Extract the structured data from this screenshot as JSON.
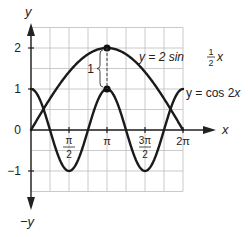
{
  "chart_data": {
    "type": "line",
    "title": "",
    "xlabel": "x",
    "ylabel": "y",
    "ylabel_negative": "−y",
    "xlim": [
      0,
      6.283185307
    ],
    "ylim": [
      -1.5,
      2.5
    ],
    "grid": true,
    "grid_x_step": "π/4",
    "grid_y_step": 0.5,
    "x_ticks": [
      {
        "value": 1.5707963,
        "label_num": "π",
        "label_den": "2"
      },
      {
        "value": 3.1415927,
        "label": "π"
      },
      {
        "value": 4.712389,
        "label_num": "3π",
        "label_den": "2"
      },
      {
        "value": 6.2831853,
        "label": "2π"
      }
    ],
    "y_ticks": [
      {
        "value": 2,
        "label": "2"
      },
      {
        "value": 1,
        "label": "1"
      },
      {
        "value": 0,
        "label": "0"
      },
      {
        "value": -1,
        "label": "−1"
      }
    ],
    "series": [
      {
        "name": "y = 2 sin ½x",
        "expression": "2*sin(x/2)",
        "label_prefix": "y = 2 sin ",
        "label_frac_num": "1",
        "label_frac_den": "2",
        "label_suffix": "x",
        "x": [
          0,
          0.785,
          1.571,
          2.356,
          3.142,
          3.927,
          4.712,
          5.498,
          6.283
        ],
        "y": [
          0,
          0.765,
          1.414,
          1.848,
          2.0,
          1.848,
          1.414,
          0.765,
          0
        ]
      },
      {
        "name": "y = cos 2x",
        "expression": "cos(2*x)",
        "label_prefix": "y = cos 2",
        "label_suffix": "x",
        "x": [
          0,
          0.785,
          1.571,
          2.356,
          3.142,
          3.927,
          4.712,
          5.498,
          6.283
        ],
        "y": [
          1,
          0,
          -1,
          0,
          1,
          0,
          -1,
          0,
          1
        ]
      }
    ],
    "annotations": [
      {
        "type": "point",
        "x": 3.1415927,
        "y": 2,
        "series": "y = 2 sin ½x"
      },
      {
        "type": "point",
        "x": 3.1415927,
        "y": 1,
        "series": "y = cos 2x"
      },
      {
        "type": "dashed-segment",
        "x": 3.1415927,
        "y_from": 1,
        "y_to": 2
      },
      {
        "type": "brace",
        "x": 3.1415927,
        "y_from": 1,
        "y_to": 2,
        "label": "1"
      }
    ]
  }
}
